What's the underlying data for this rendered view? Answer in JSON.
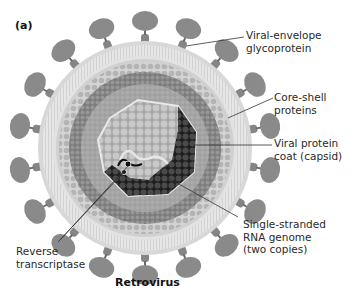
{
  "figure": {
    "panel_label": "(a)",
    "caption": "Retrovirus",
    "labels": {
      "envelope_glycoprotein": "Viral-envelope\nglycoprotein",
      "core_shell": "Core-shell\nproteins",
      "capsid": "Viral protein\ncoat (capsid)",
      "rna": "Single-stranded\nRNA genome\n(two copies)",
      "reverse_transcriptase": "Reverse\ntranscriptase"
    },
    "colors": {
      "spike": "#8a8a8a",
      "envelope_outer": "#dcdcdc",
      "envelope_inner": "#e8e8e8",
      "core_shell_dots": "#b0b0b0",
      "inner_matrix": "#8c8c8c",
      "capsid_light": "#c4c4c4",
      "capsid_dark": "#333333",
      "leader": "#333333"
    }
  }
}
